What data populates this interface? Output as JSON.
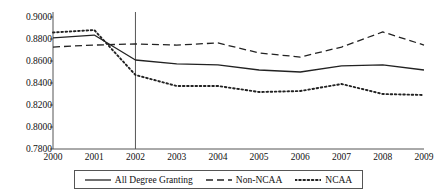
{
  "chart_data": {
    "type": "line",
    "title": "",
    "subtitle": "",
    "xlabel": "",
    "ylabel": "",
    "x": [
      2000,
      2001,
      2002,
      2003,
      2004,
      2005,
      2006,
      2007,
      2008,
      2009
    ],
    "xtick_labels": [
      "2000",
      "2001",
      "2002",
      "2003",
      "2004",
      "2005",
      "2006",
      "2007",
      "2008",
      "2009"
    ],
    "ytick_labels": [
      "0.9000",
      "0.8800",
      "0.8600",
      "0.8400",
      "0.8200",
      "0.8000",
      "0.7800"
    ],
    "ytick_values": [
      0.9,
      0.88,
      0.86,
      0.84,
      0.82,
      0.8,
      0.78
    ],
    "ylim": [
      0.78,
      0.9
    ],
    "xlim": [
      2000,
      2009
    ],
    "grid": false,
    "legend_position": "bottom",
    "annotations": [
      {
        "type": "vertical-reference-line",
        "x": 2002,
        "style": "solid",
        "color": "#555555"
      }
    ],
    "series": [
      {
        "name": "All Degree Granting",
        "style": "solid",
        "color": "#222222",
        "values": [
          0.881,
          0.8836,
          0.8609,
          0.8573,
          0.8564,
          0.8518,
          0.85,
          0.8555,
          0.8564,
          0.8518
        ]
      },
      {
        "name": "Non-NCAA",
        "style": "dashed",
        "color": "#222222",
        "values": [
          0.8727,
          0.8745,
          0.8755,
          0.8745,
          0.8764,
          0.8673,
          0.8636,
          0.8727,
          0.8864,
          0.8745
        ]
      },
      {
        "name": "NCAA",
        "style": "dotted",
        "color": "#222222",
        "values": [
          0.8859,
          0.8882,
          0.8473,
          0.8373,
          0.8373,
          0.8318,
          0.8327,
          0.8391,
          0.83,
          0.8291
        ]
      }
    ]
  },
  "legend": {
    "entries": [
      {
        "label": "All Degree Granting",
        "style": "solid"
      },
      {
        "label": "Non-NCAA",
        "style": "dashed"
      },
      {
        "label": "NCAA",
        "style": "dotted"
      }
    ]
  },
  "colors": {
    "axis": "#555555",
    "line": "#222222",
    "background": "#ffffff",
    "text": "#111111"
  }
}
